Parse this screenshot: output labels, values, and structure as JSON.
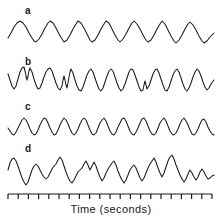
{
  "figure": {
    "background_color": "#ffffff",
    "stroke_color": "#1b1b1b",
    "width": 222,
    "height": 219
  },
  "axis": {
    "caption": "Time (seconds)",
    "tick_count": 21,
    "x_start": 8,
    "x_end": 212,
    "y": 194,
    "tick_length": 5,
    "tick_direction": "down"
  },
  "traces": [
    {
      "label": "a",
      "label_x": 25,
      "label_y": 6,
      "baseline_y": 34,
      "amplitude": 13,
      "cycles": 10,
      "description": "regular smooth sinusoidal oscillation",
      "x_start": 8,
      "x_end": 214,
      "points": "8,38 11,33 14,27 17,23 20,21 23,23 26,27 29,33 32,38 34,41 36,42 39,39 42,34 45,28 48,23 50,21 53,23 56,28 59,34 62,39 64,42 67,40 70,35 73,29 76,24 78,21 81,23 84,28 87,34 90,40 92,42 95,40 98,35 101,29 104,24 106,21 109,23 112,29 115,35 118,40 120,42 123,39 126,34 129,28 132,23 134,21 137,24 140,29 143,35 146,40 148,42 151,40 154,35 157,29 160,24 162,21 165,24 168,30 171,36 174,41 176,43 179,40 182,35 185,29 188,24 190,22 193,25 196,30 199,36 202,41 204,43 207,41 210,37 214,33"
    },
    {
      "label": "b",
      "label_x": 25,
      "label_y": 57,
      "baseline_y": 81,
      "amplitude": 14,
      "cycles": 10,
      "description": "irregular oscillation with notched and split peaks",
      "x_start": 8,
      "x_end": 214,
      "points": "8,74 10,80 12,86 14,89 16,86 18,79 20,72 22,68 24,67 25,71 26,76 27,80 28,76 29,71 30,68 32,72 34,79 36,85 38,89 40,88 42,83 44,77 46,72 48,69 50,68 52,71 54,77 56,83 58,88 60,90 62,86 63,80 64,76 65,80 66,85 67,88 68,83 69,77 70,72 71,69 73,73 75,80 77,86 79,90 81,91 83,87 85,81 87,75 89,71 91,69 93,72 95,78 97,84 99,89 101,91 103,88 105,82 107,76 109,71 111,69 113,71 115,77 117,83 119,88 121,91 123,89 125,84 127,78 129,72 131,69 133,70 135,75 137,81 139,87 141,91 143,90 144,85 145,81 146,85 147,89 149,86 151,80 153,74 155,70 157,69 159,73 161,79 163,85 165,90 167,91 169,87 171,81 173,75 175,71 177,69 179,72 181,78 183,84 185,89 187,91 189,88 191,83 193,77 195,72 197,69 199,71 201,76 203,82 205,87 207,90 209,88 211,84 214,80"
    },
    {
      "label": "c",
      "label_x": 25,
      "label_y": 102,
      "baseline_y": 127,
      "amplitude": 9,
      "cycles": 11,
      "description": "regular lower-amplitude sinusoidal oscillation",
      "x_start": 8,
      "x_end": 214,
      "points": "8,128 10,131 12,134 14,135 16,132 18,128 20,124 22,120 24,118 26,120 28,124 30,129 32,133 34,135 36,134 38,130 40,125 42,121 44,118 46,119 48,123 50,128 52,132 54,135 56,134 58,130 60,125 62,121 64,118 66,120 68,124 70,129 72,133 74,135 76,133 78,129 80,124 82,120 84,118 86,120 88,125 90,130 92,134 94,135 96,133 98,128 100,123 102,120 104,118 106,121 108,126 110,131 112,134 114,135 116,132 118,127 120,123 122,119 124,118 126,121 128,126 130,131 132,134 134,135 136,132 138,128 140,123 142,119 144,118 146,121 148,126 150,131 152,134 154,135 156,133 158,128 160,123 162,120 164,118 166,121 168,126 170,131 172,134 174,135 176,133 178,129 180,124 182,120 184,118 186,121 188,125 190,130 192,134 194,135 196,133 198,129 200,124 202,120 204,119 206,122 208,127 210,131 212,134 214,135"
    },
    {
      "label": "d",
      "label_x": 25,
      "label_y": 144,
      "baseline_y": 172,
      "amplitude": 16,
      "cycles": 0,
      "description": "chaotic irregular waveform with sharp spikes and varying amplitude",
      "x_start": 8,
      "x_end": 214,
      "points": "8,170 10,163 12,159 14,158 16,161 18,166 20,172 22,178 24,182 26,185 28,182 30,176 32,170 34,166 36,164 38,166 40,170 42,174 44,177 46,179 48,177 50,173 52,169 54,166 56,164 58,160 60,157 62,160 64,166 66,172 68,177 70,181 72,183 74,180 76,176 78,172 80,170 82,168 84,164 86,161 88,165 90,170 92,166 94,162 96,166 98,172 100,177 102,181 104,178 106,173 108,169 110,166 112,163 114,161 116,165 118,171 120,176 122,180 124,183 126,180 128,175 130,170 132,167 134,165 136,168 138,173 140,178 142,181 144,178 146,173 148,168 150,164 152,161 154,158 156,162 158,168 160,173 162,177 164,173 166,167 168,161 170,157 172,155 174,159 176,165 178,170 180,175 182,179 184,182 186,179 188,174 190,170 192,173 194,177 196,180 198,177 200,172 202,169 204,172 206,176 208,179 210,178 212,176 214,175"
    }
  ]
}
